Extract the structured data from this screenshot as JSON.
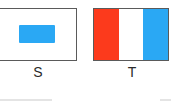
{
  "colors": {
    "border": "#5a5a5a",
    "white": "#ffffff",
    "blue": "#2aa8f4",
    "red": "#fc3a1c",
    "label": "#2a2a2a"
  },
  "flags": [
    {
      "id": "S",
      "label": "S",
      "design": "white field with centered blue rectangle",
      "field_color": "#ffffff",
      "inner_rect_color": "#2aa8f4"
    },
    {
      "id": "T",
      "label": "T",
      "design": "vertical tricolor",
      "stripes": [
        {
          "position": "left",
          "color": "#fc3a1c"
        },
        {
          "position": "center",
          "color": "#ffffff"
        },
        {
          "position": "right",
          "color": "#2aa8f4"
        }
      ]
    }
  ]
}
